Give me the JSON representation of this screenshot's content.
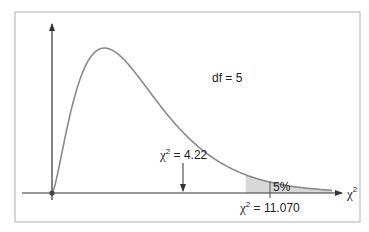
{
  "chart_data": {
    "type": "line",
    "title": "",
    "subtitle": "",
    "distribution": "chi-square",
    "df_label": "df = 5",
    "df": 5,
    "xlabel": "χ²",
    "ylabel": "",
    "grid": false,
    "legend": null,
    "annotations": [
      {
        "text_symbol": "χ",
        "text_sup": "2",
        "text_value": " = 4.22",
        "x": 4.22,
        "type": "arrow-down"
      },
      {
        "text_symbol": "χ",
        "text_sup": "2",
        "text_value": " = 11.070",
        "x": 11.07,
        "type": "critical-value"
      },
      {
        "text": "5%",
        "type": "shaded-tail",
        "x_start": 11.07
      }
    ],
    "x_range": [
      0,
      16
    ],
    "shaded_area_percent": 5,
    "colors": {
      "curve": "#8a8a8a",
      "axes": "#333333",
      "frame": "#b0b0b0",
      "shade": "#d8d8d8"
    }
  },
  "labels": {
    "df": "df = 5",
    "obs_symbol": "χ",
    "obs_sup": "2",
    "obs_value": " = 4.22",
    "crit_symbol": "χ",
    "crit_sup": "2",
    "crit_value": " = 11.070",
    "tail_pct": "5%",
    "axis_symbol": "χ",
    "axis_sup": "2"
  }
}
